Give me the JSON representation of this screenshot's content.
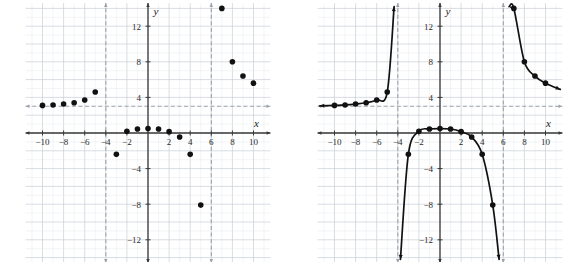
{
  "figure": {
    "type": "two-panel-graph",
    "background": "#ffffff",
    "grid_color": "#c9cfd6",
    "minor_grid_color": "#e4e8ec",
    "axis_color": "#3a3a3a",
    "asymptote_color": "#9aa3ab",
    "point_color": "#111111",
    "curve_color": "#111111"
  },
  "axes": {
    "x_label": "x",
    "y_label": "y",
    "x_ticks": [
      "-10",
      "-8",
      "-6",
      "-4",
      "-2",
      "2",
      "4",
      "6",
      "8",
      "10"
    ],
    "x_tick_values": [
      -10,
      -8,
      -6,
      -4,
      -2,
      2,
      4,
      6,
      8,
      10
    ],
    "y_ticks": [
      "12",
      "8",
      "4",
      "-4",
      "-8",
      "-12"
    ],
    "y_tick_values": [
      12,
      8,
      4,
      -4,
      -8,
      -12
    ],
    "xlim": [
      -11.6,
      11.6
    ],
    "ylim": [
      -14.6,
      14.6
    ],
    "grid": true
  },
  "asymptotes": {
    "vertical": [
      -4,
      6
    ],
    "horizontal": [
      3
    ],
    "style": "dashed"
  },
  "chart_data": [
    {
      "type": "scatter",
      "title": "",
      "xlabel": "x",
      "ylabel": "y",
      "xlim": [
        -11.6,
        11.6
      ],
      "ylim": [
        -14.6,
        14.6
      ],
      "grid": true,
      "asymptotes_vertical": [
        -4,
        6
      ],
      "asymptotes_horizontal": [
        3
      ],
      "x": [
        -10,
        -9,
        -8,
        -7,
        -6,
        -5,
        -3,
        -2,
        -1,
        0,
        1,
        2,
        3,
        4,
        5,
        7,
        8,
        9,
        10
      ],
      "y": [
        3.1,
        3.15,
        3.25,
        3.4,
        3.7,
        4.6,
        -2.4,
        0.2,
        0.45,
        0.5,
        0.45,
        0.15,
        -0.45,
        -2.4,
        -8.1,
        14.0,
        8.0,
        6.4,
        5.6
      ]
    },
    {
      "type": "line",
      "title": "",
      "xlabel": "x",
      "ylabel": "y",
      "xlim": [
        -11.6,
        11.6
      ],
      "ylim": [
        -14.6,
        14.6
      ],
      "grid": true,
      "asymptotes_vertical": [
        -4,
        6
      ],
      "asymptotes_horizontal": [
        3
      ],
      "markers": true,
      "branches": [
        {
          "name": "left-branch",
          "x": [
            -11.4,
            -10,
            -9,
            -8,
            -7,
            -6,
            -5,
            -4.35
          ],
          "y": [
            3.05,
            3.1,
            3.15,
            3.25,
            3.4,
            3.7,
            4.6,
            14.2
          ]
        },
        {
          "name": "middle-branch",
          "x": [
            -3.75,
            -3,
            -2,
            -1,
            0,
            1,
            2,
            3,
            4,
            5,
            5.6
          ],
          "y": [
            -14.2,
            -2.4,
            0.2,
            0.45,
            0.5,
            0.45,
            0.15,
            -0.45,
            -2.4,
            -8.1,
            -14.2
          ]
        },
        {
          "name": "right-branch",
          "x": [
            6.55,
            7,
            8,
            9,
            10,
            11.4
          ],
          "y": [
            14.2,
            14.0,
            8.0,
            6.4,
            5.6,
            4.9
          ]
        }
      ]
    }
  ]
}
